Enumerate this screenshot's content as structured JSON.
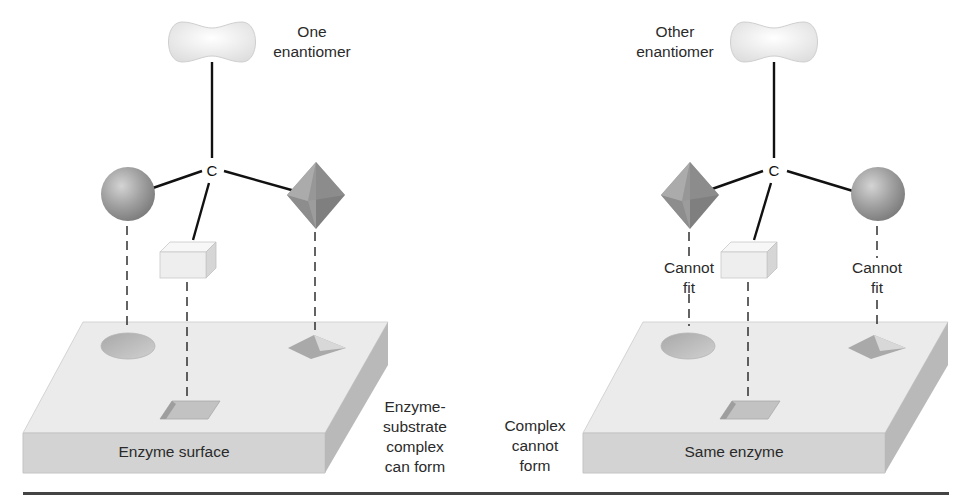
{
  "figure": {
    "panels": [
      {
        "id": "left",
        "enantiomer_label": "One\nenantiomer",
        "center_atom": "C",
        "surface_label": "Enzyme surface",
        "outcome_label": "Enzyme-\nsubstrate\ncomplex\ncan form",
        "substituents": {
          "top": "cloud",
          "left": "sphere",
          "right": "octahedron",
          "front": "box"
        },
        "fit_labels": []
      },
      {
        "id": "right",
        "enantiomer_label": "Other\nenantiomer",
        "center_atom": "C",
        "surface_label": "Same enzyme",
        "outcome_label": "Complex\ncannot\nform",
        "substituents": {
          "top": "cloud",
          "left": "octahedron",
          "right": "sphere",
          "front": "box"
        },
        "fit_labels": [
          "Cannot\nfit",
          "Cannot\nfit"
        ]
      }
    ],
    "colors": {
      "background": "#ffffff",
      "slab_top": "#ebebeb",
      "slab_front": "#d2d2d2",
      "slab_side": "#b8b8b8",
      "sphere": "#9a9a9a",
      "octahedron": "#8c8c8c",
      "box": "#f0f0f0",
      "cloud": "#f2f2f2",
      "bond": "#111111",
      "rule": "#444444"
    }
  }
}
